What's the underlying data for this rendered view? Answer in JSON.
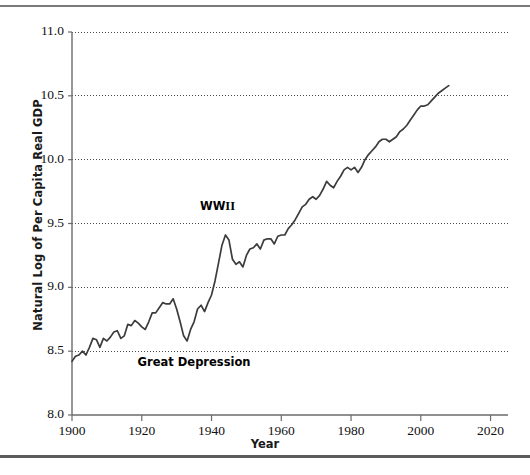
{
  "figure": {
    "background_color": "#ffffff",
    "line_color": "#3c3c3c",
    "axis_color": "#6b6b6b",
    "grid_color": "#4a4a4a",
    "top_rule_color": "#7a7a7a",
    "bottom_rule_color": "#5b5b5b"
  },
  "axes": {
    "ylabel": "Natural Log of Per Capita Real GDP",
    "xlabel": "Year",
    "y_ticks": [
      "8.0",
      "8.5",
      "9.0",
      "9.5",
      "10.0",
      "10.5",
      "11.0"
    ],
    "x_ticks": [
      "1900",
      "1920",
      "1940",
      "1960",
      "1980",
      "2000",
      "2020"
    ]
  },
  "annotations": {
    "ww2_prefix": "WW",
    "ww2_numeral": "II",
    "great_depression": "Great Depression"
  },
  "chart_data": {
    "type": "line",
    "title": "",
    "subtitle": "",
    "xlabel": "Year",
    "ylabel": "Natural Log of Per Capita Real GDP",
    "xlim": [
      1900,
      2025
    ],
    "ylim": [
      8.0,
      11.0
    ],
    "y_ticks": [
      8.0,
      8.5,
      9.0,
      9.5,
      10.0,
      10.5,
      11.0
    ],
    "x_ticks": [
      1900,
      1920,
      1940,
      1960,
      1980,
      2000,
      2020
    ],
    "grid": "horizontal-dotted",
    "legend": "none",
    "annotations": [
      {
        "text": "WW II",
        "x": 1943,
        "y": 9.63
      },
      {
        "text": "Great Depression",
        "x": 1932,
        "y": 8.41
      }
    ],
    "series": [
      {
        "name": "Natural log of US per capita real GDP",
        "color": "#3c3c3c",
        "x": [
          1900,
          1901,
          1902,
          1903,
          1904,
          1905,
          1906,
          1907,
          1908,
          1909,
          1910,
          1911,
          1912,
          1913,
          1914,
          1915,
          1916,
          1917,
          1918,
          1919,
          1920,
          1921,
          1922,
          1923,
          1924,
          1925,
          1926,
          1927,
          1928,
          1929,
          1930,
          1931,
          1932,
          1933,
          1934,
          1935,
          1936,
          1937,
          1938,
          1939,
          1940,
          1941,
          1942,
          1943,
          1944,
          1945,
          1946,
          1947,
          1948,
          1949,
          1950,
          1951,
          1952,
          1953,
          1954,
          1955,
          1956,
          1957,
          1958,
          1959,
          1960,
          1961,
          1962,
          1963,
          1964,
          1965,
          1966,
          1967,
          1968,
          1969,
          1970,
          1971,
          1972,
          1973,
          1974,
          1975,
          1976,
          1977,
          1978,
          1979,
          1980,
          1981,
          1982,
          1983,
          1984,
          1985,
          1986,
          1987,
          1988,
          1989,
          1990,
          1991,
          1992,
          1993,
          1994,
          1995,
          1996,
          1997,
          1998,
          1999,
          2000,
          2001,
          2002,
          2003,
          2004,
          2005,
          2006,
          2007,
          2008
        ],
        "y": [
          8.42,
          8.46,
          8.47,
          8.5,
          8.47,
          8.53,
          8.6,
          8.59,
          8.53,
          8.6,
          8.58,
          8.61,
          8.65,
          8.66,
          8.6,
          8.62,
          8.71,
          8.7,
          8.74,
          8.72,
          8.69,
          8.67,
          8.73,
          8.8,
          8.8,
          8.84,
          8.88,
          8.87,
          8.87,
          8.91,
          8.83,
          8.73,
          8.62,
          8.58,
          8.67,
          8.73,
          8.83,
          8.86,
          8.81,
          8.88,
          8.94,
          9.05,
          9.19,
          9.33,
          9.41,
          9.37,
          9.22,
          9.18,
          9.2,
          9.16,
          9.25,
          9.3,
          9.31,
          9.34,
          9.3,
          9.37,
          9.38,
          9.38,
          9.34,
          9.4,
          9.41,
          9.41,
          9.46,
          9.49,
          9.53,
          9.58,
          9.63,
          9.65,
          9.69,
          9.71,
          9.69,
          9.72,
          9.77,
          9.83,
          9.8,
          9.78,
          9.83,
          9.87,
          9.92,
          9.94,
          9.92,
          9.94,
          9.9,
          9.94,
          10.0,
          10.04,
          10.07,
          10.1,
          10.14,
          10.16,
          10.16,
          10.14,
          10.16,
          10.18,
          10.22,
          10.24,
          10.27,
          10.31,
          10.35,
          10.39,
          10.42,
          10.42,
          10.43,
          10.46,
          10.49,
          10.52,
          10.54,
          10.56,
          10.58
        ]
      }
    ]
  }
}
